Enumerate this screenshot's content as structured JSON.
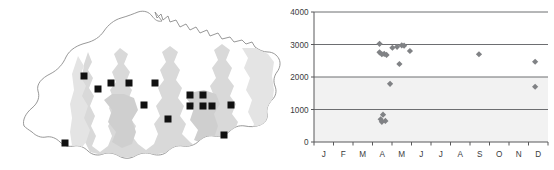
{
  "figure": {
    "title": "",
    "panels": [
      "distribution-map",
      "altitude-scatter"
    ]
  },
  "map": {
    "name": "Bhutan",
    "region_label": "",
    "outline_color": "#8c8c8c",
    "land_fill": "#ffffff",
    "shaded_fill": "#d7d7d7",
    "marker_color": "#111111",
    "marker_shape": "square",
    "marker_count": 15,
    "markers": [
      {
        "x": 84,
        "y": 76
      },
      {
        "x": 98,
        "y": 89
      },
      {
        "x": 111,
        "y": 83
      },
      {
        "x": 129,
        "y": 83
      },
      {
        "x": 155,
        "y": 83
      },
      {
        "x": 190,
        "y": 95
      },
      {
        "x": 203,
        "y": 95
      },
      {
        "x": 190,
        "y": 106
      },
      {
        "x": 203,
        "y": 106
      },
      {
        "x": 212,
        "y": 106
      },
      {
        "x": 231,
        "y": 105
      },
      {
        "x": 168,
        "y": 119
      },
      {
        "x": 224,
        "y": 135
      },
      {
        "x": 65,
        "y": 143
      },
      {
        "x": 144,
        "y": 105
      }
    ]
  },
  "chart_data": {
    "type": "scatter",
    "title": "",
    "xlabel": "",
    "ylabel": "",
    "ylim": [
      0,
      4000
    ],
    "ytick_labels": [
      "0",
      "1000",
      "2000",
      "3000",
      "4000"
    ],
    "ytick_values": [
      0,
      1000,
      2000,
      3000,
      4000
    ],
    "xtick_labels": [
      "J",
      "F",
      "M",
      "A",
      "M",
      "J",
      "J",
      "A",
      "S",
      "O",
      "N",
      "D"
    ],
    "x_categories": [
      "J",
      "F",
      "M",
      "A",
      "M",
      "J",
      "J",
      "A",
      "S",
      "O",
      "N",
      "D"
    ],
    "grid": "horizontal",
    "legend": "none",
    "marker_shape": "diamond",
    "marker_color": "#808285",
    "band_color": "#f2f2f2",
    "bands": [
      {
        "from": 0,
        "to": 1000
      },
      {
        "from": 1000,
        "to": 2000
      }
    ],
    "points": [
      {
        "month": "A",
        "month_index": 4,
        "x_frac": 0.28,
        "value": 3020
      },
      {
        "month": "A",
        "month_index": 4,
        "x_frac": 0.28,
        "value": 2760
      },
      {
        "month": "A",
        "month_index": 4,
        "x_frac": 0.29,
        "value": 2700
      },
      {
        "month": "A",
        "month_index": 4,
        "x_frac": 0.3,
        "value": 2710
      },
      {
        "month": "A",
        "month_index": 4,
        "x_frac": 0.31,
        "value": 2680
      },
      {
        "month": "A",
        "month_index": 4,
        "x_frac": 0.335,
        "value": 2900
      },
      {
        "month": "M",
        "month_index": 5,
        "x_frac": 0.355,
        "value": 2930
      },
      {
        "month": "M",
        "month_index": 5,
        "x_frac": 0.375,
        "value": 2975
      },
      {
        "month": "M",
        "month_index": 5,
        "x_frac": 0.385,
        "value": 2965
      },
      {
        "month": "M",
        "month_index": 5,
        "x_frac": 0.41,
        "value": 2800
      },
      {
        "month": "M",
        "month_index": 5,
        "x_frac": 0.365,
        "value": 2400
      },
      {
        "month": "A",
        "month_index": 4,
        "x_frac": 0.325,
        "value": 1790
      },
      {
        "month": "A",
        "month_index": 4,
        "x_frac": 0.295,
        "value": 840
      },
      {
        "month": "A",
        "month_index": 4,
        "x_frac": 0.285,
        "value": 700
      },
      {
        "month": "A",
        "month_index": 4,
        "x_frac": 0.29,
        "value": 620
      },
      {
        "month": "A",
        "month_index": 4,
        "x_frac": 0.305,
        "value": 650
      },
      {
        "month": "S",
        "month_index": 9,
        "x_frac": 0.705,
        "value": 2700
      },
      {
        "month": "D",
        "month_index": 12,
        "x_frac": 0.945,
        "value": 2470
      },
      {
        "month": "D",
        "month_index": 12,
        "x_frac": 0.945,
        "value": 1700
      }
    ]
  }
}
